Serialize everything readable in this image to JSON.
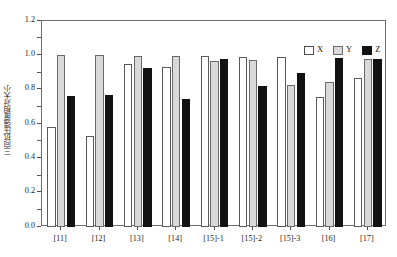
{
  "chart_data": {
    "type": "bar",
    "title": "",
    "xlabel": "",
    "ylabel": "三向抗压强度相对大小",
    "ylim": [
      0.0,
      1.2
    ],
    "ytick_labels": [
      "0.0",
      "0.2",
      "0.4",
      "0.6",
      "0.8",
      "1.0",
      "1.2"
    ],
    "ytick_values": [
      0.0,
      0.2,
      0.4,
      0.6,
      0.8,
      1.0,
      1.2
    ],
    "minor_ticks": true,
    "grid": false,
    "legend_position": "top-right",
    "categories": [
      "[11]",
      "[12]",
      "[13]",
      "[14]",
      "[15]-1",
      "[15]-2",
      "[15]-3",
      "[16]",
      "[17]"
    ],
    "series": [
      {
        "name": "X",
        "color": "#ffffff",
        "values": [
          0.58,
          0.53,
          0.95,
          0.93,
          0.995,
          0.99,
          0.99,
          0.755,
          0.87
        ]
      },
      {
        "name": "Y",
        "color": "#d9d9d9",
        "values": [
          1.0,
          1.0,
          0.995,
          0.995,
          0.965,
          0.975,
          0.83,
          0.845,
          0.98
        ]
      },
      {
        "name": "Z",
        "color": "#121212",
        "values": [
          0.765,
          0.77,
          0.925,
          0.745,
          0.98,
          0.82,
          0.895,
          0.985,
          0.98
        ]
      }
    ]
  },
  "legend": {
    "entries": [
      {
        "label": "X"
      },
      {
        "label": "Y"
      },
      {
        "label": "Z"
      }
    ]
  }
}
